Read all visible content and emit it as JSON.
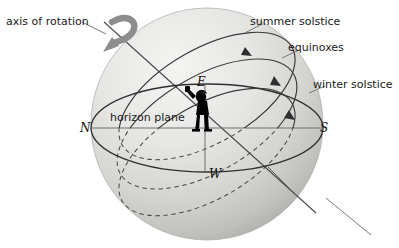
{
  "figure": {
    "canvas": {
      "width": 399,
      "height": 248
    },
    "background_color": "#ffffff"
  },
  "labels": {
    "axis_of_rotation": "axis of rotation",
    "summer_solstice": "summer solstice",
    "equinoxes": "equinoxes",
    "winter_solstice": "winter solstice",
    "horizon_plane": "horizon plane",
    "north": "N",
    "south": "S",
    "east": "E",
    "west": "W"
  },
  "colors": {
    "sphere_light": "#f2f2f0",
    "sphere_mid": "#dcdcda",
    "sphere_dark": "#b8b8b6",
    "outline": "#3a3a3a",
    "line": "#4a4a4a",
    "leader": "#6b6b6b",
    "text": "#1a1a1a",
    "observer": "#000000",
    "arrow_gray": "#8a8a8a"
  },
  "elements": {
    "sphere": "celestial sphere shaded globe",
    "horizon_plane": "horizontal ellipse through observer",
    "observer": "human figure silhouette at sphere centre",
    "sun_paths": [
      {
        "name": "summer solstice",
        "style": "solid above horizon, dashed below",
        "arrow": true
      },
      {
        "name": "equinoxes",
        "style": "solid above horizon, dashed below",
        "arrow": true
      },
      {
        "name": "winter solstice",
        "style": "solid above horizon, dashed below",
        "arrow": true
      }
    ],
    "rotation_arrow": "curved arrow around polar axis",
    "axis_line": "straight tilted line from upper-left to lower-right through sphere"
  }
}
